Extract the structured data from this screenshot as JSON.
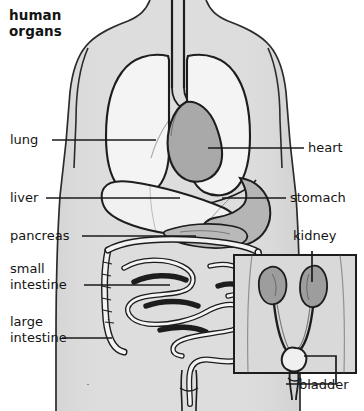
{
  "figure": {
    "title": "human\norgans",
    "type": "anatomical-diagram",
    "background_color": "#ffffff",
    "body_fill_color": "#dcdcdc",
    "organ_fill_light": "#f2f2f2",
    "organ_fill_mid": "#c9c9c9",
    "organ_fill_dark": "#a8a8a8",
    "outline_color": "#1a1a1a",
    "leader_color": "#1a1a1a"
  },
  "labels": {
    "left": [
      {
        "id": "lung",
        "text": "lung"
      },
      {
        "id": "liver",
        "text": "liver"
      },
      {
        "id": "pancreas",
        "text": "pancreas"
      },
      {
        "id": "small-intestine",
        "text": "small\nintestine"
      },
      {
        "id": "large-intestine",
        "text": "large\nintestine"
      }
    ],
    "right": [
      {
        "id": "heart",
        "text": "heart"
      },
      {
        "id": "stomach",
        "text": "stomach"
      },
      {
        "id": "kidney",
        "text": "kidney"
      },
      {
        "id": "bladder",
        "text": "bladder"
      }
    ]
  },
  "inset": {
    "name": "urinary-system-inset",
    "contents": [
      "kidney",
      "kidney",
      "ureter",
      "ureter",
      "bladder",
      "urethra"
    ],
    "border_color": "#1a1a1a"
  },
  "organs": [
    {
      "id": "trachea",
      "label": "trachea",
      "shown_label": false
    },
    {
      "id": "lung-left",
      "label": "lung",
      "shown_label": true
    },
    {
      "id": "lung-right",
      "label": "lung",
      "shown_label": false
    },
    {
      "id": "heart",
      "label": "heart",
      "shown_label": true
    },
    {
      "id": "liver",
      "label": "liver",
      "shown_label": true
    },
    {
      "id": "stomach",
      "label": "stomach",
      "shown_label": true
    },
    {
      "id": "pancreas",
      "label": "pancreas",
      "shown_label": true
    },
    {
      "id": "small-intestine",
      "label": "small intestine",
      "shown_label": true
    },
    {
      "id": "large-intestine",
      "label": "large intestine",
      "shown_label": true
    },
    {
      "id": "kidney",
      "label": "kidney",
      "shown_label": true
    },
    {
      "id": "bladder",
      "label": "bladder",
      "shown_label": true
    }
  ]
}
